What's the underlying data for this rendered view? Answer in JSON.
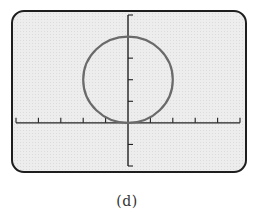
{
  "chart_data": {
    "type": "line",
    "title": "",
    "caption": "(d)",
    "xlabel": "",
    "ylabel": "",
    "x_ticks": [
      -5,
      -4,
      -3,
      -2,
      -1,
      0,
      1,
      2,
      3,
      4,
      5
    ],
    "y_ticks": [
      -2,
      -1,
      0,
      1,
      2,
      3,
      4,
      5
    ],
    "xlim": [
      -5,
      5
    ],
    "ylim": [
      -2,
      5
    ],
    "grid": false,
    "tick_labels_shown": false,
    "series": [
      {
        "name": "circle",
        "equation": "x^2 + (y - 2)^2 = 4",
        "center": [
          0,
          2
        ],
        "radius": 2,
        "color": "#6a6a6a"
      }
    ],
    "colors": {
      "screen_background": "#ededed",
      "frame": "#1e1e1e",
      "axes": "#222222"
    }
  }
}
